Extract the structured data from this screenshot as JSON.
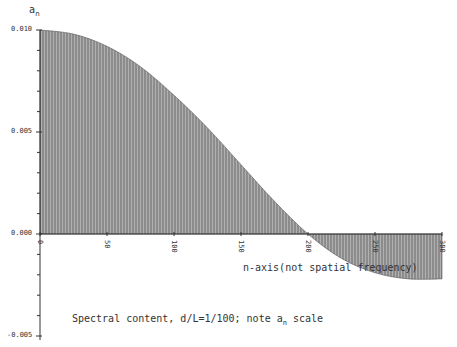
{
  "chart_data": {
    "type": "area",
    "title": "",
    "ylabel": "a_n",
    "xlabel": "n-axis(not spatial frequency)",
    "caption": "Spectral content, d/L=1/100; note a_n scale",
    "xlim": [
      0,
      300
    ],
    "ylim": [
      -0.005,
      0.01
    ],
    "x_ticks": [
      "0",
      "50",
      "100",
      "150",
      "200",
      "250",
      "300"
    ],
    "y_ticks": [
      "0.010",
      "0.005",
      "0.000",
      "-0.005"
    ],
    "grid": false,
    "legend": null,
    "fill": "vertical hatch shading under curve",
    "x": [
      0,
      25,
      50,
      75,
      100,
      125,
      150,
      175,
      200,
      225,
      250,
      275,
      300
    ],
    "values": [
      0.01,
      0.0098,
      0.0092,
      0.0082,
      0.0068,
      0.0052,
      0.0034,
      0.0016,
      0.0,
      -0.0012,
      -0.0019,
      -0.0022,
      -0.0022
    ]
  },
  "labels": {
    "y_axis_symbol": "a",
    "y_axis_subscript": "n",
    "y_ticks": [
      "0.010",
      "0.005",
      "0.000",
      "-0.005"
    ],
    "x_ticks": [
      "0",
      "50",
      "100",
      "150",
      "200",
      "250",
      "300"
    ],
    "x_axis_title": "n-axis(not spatial frequency)",
    "caption_prefix": "Spectral content, d/L=1/100; note a",
    "caption_subscript": "n",
    "caption_suffix": " scale"
  },
  "colors": {
    "fill": "#8a8a8a",
    "hatch": "#a8a8a8",
    "axis": "#333333",
    "text": "#333333"
  }
}
